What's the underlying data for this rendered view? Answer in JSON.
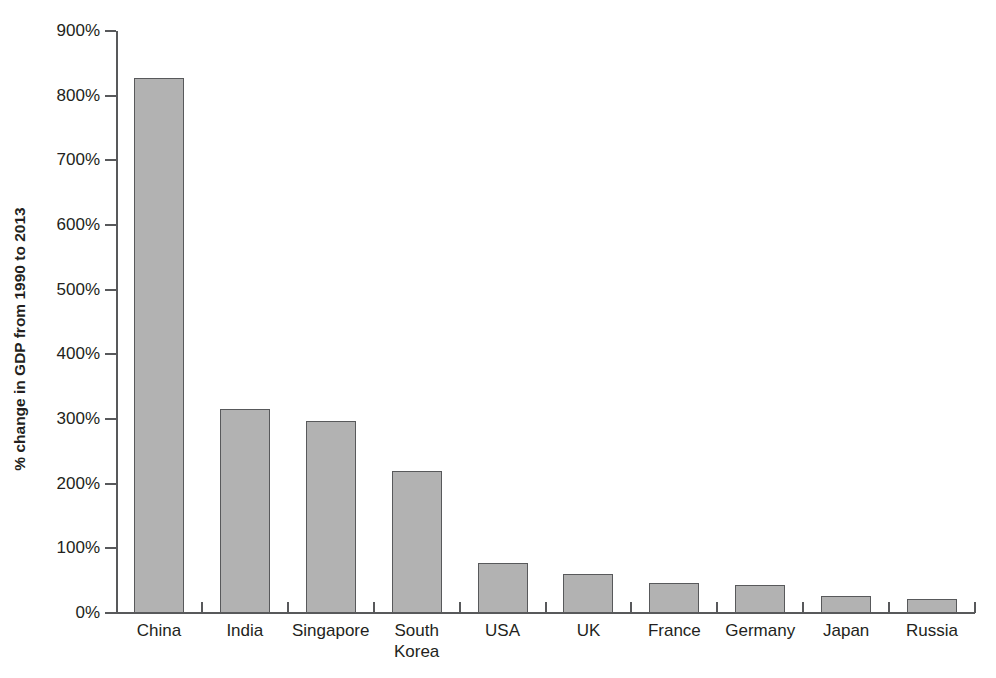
{
  "chart_data": {
    "type": "bar",
    "title": "",
    "xlabel": "",
    "ylabel": "% change in GDP from 1990 to 2013",
    "categories": [
      "China",
      "India",
      "Singapore",
      "South\nKorea",
      "USA",
      "UK",
      "France",
      "Germany",
      "Japan",
      "Russia"
    ],
    "values": [
      827,
      315,
      297,
      219,
      78,
      60,
      46,
      43,
      27,
      21
    ],
    "value_unit": "%",
    "ylim": [
      0,
      900
    ],
    "ytick_values": [
      0,
      100,
      200,
      300,
      400,
      500,
      600,
      700,
      800,
      900
    ],
    "ytick_labels": [
      "0%",
      "100%",
      "200%",
      "300%",
      "400%",
      "500%",
      "600%",
      "700%",
      "800%",
      "900%"
    ],
    "grid": false,
    "legend": "none",
    "bar_color": "#b2b2b2",
    "bar_border_color": "#58595b",
    "axis_color": "#58595b"
  }
}
